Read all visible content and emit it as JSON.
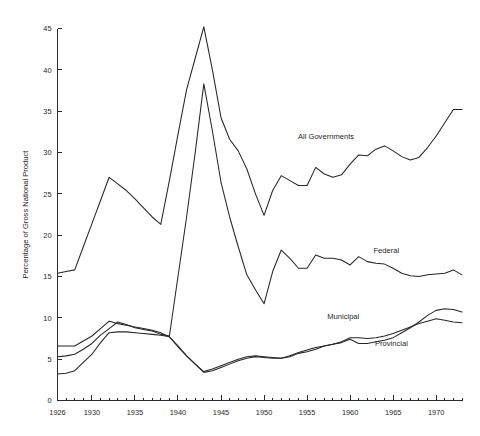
{
  "chart_data": {
    "type": "line",
    "title": "",
    "subtitle": "",
    "xlabel": "",
    "ylabel": "Percentage of Gross National Product",
    "xlim": [
      1926,
      1973
    ],
    "ylim": [
      0,
      45
    ],
    "grid": false,
    "legend_position": "inline-annotations",
    "x_ticks": [
      1926,
      1930,
      1935,
      1940,
      1945,
      1950,
      1955,
      1960,
      1965,
      1970
    ],
    "x_tick_labels": [
      "1926",
      "1930",
      "1935",
      "1940",
      "1945",
      "1950",
      "1955",
      "1960",
      "1965",
      "1970"
    ],
    "x_minor_ticks": [
      1926,
      1927,
      1928,
      1929,
      1930,
      1931,
      1932,
      1933,
      1934,
      1935,
      1936,
      1937,
      1938,
      1939,
      1940,
      1941,
      1942,
      1943,
      1944,
      1945,
      1946,
      1947,
      1948,
      1949,
      1950,
      1951,
      1952,
      1953,
      1954,
      1955,
      1956,
      1957,
      1958,
      1959,
      1960,
      1961,
      1962,
      1963,
      1964,
      1965,
      1966,
      1967,
      1968,
      1969,
      1970,
      1971,
      1972,
      1973
    ],
    "y_ticks": [
      0,
      5,
      10,
      15,
      20,
      25,
      30,
      35,
      40,
      45
    ],
    "y_tick_labels": [
      "0",
      "5",
      "10",
      "15",
      "20",
      "25",
      "30",
      "35",
      "40",
      "45"
    ],
    "x": [
      1926,
      1927,
      1928,
      1929,
      1930,
      1931,
      1932,
      1933,
      1934,
      1935,
      1936,
      1937,
      1938,
      1939,
      1940,
      1941,
      1942,
      1943,
      1944,
      1945,
      1946,
      1947,
      1948,
      1949,
      1950,
      1951,
      1952,
      1953,
      1954,
      1955,
      1956,
      1957,
      1958,
      1959,
      1960,
      1961,
      1962,
      1963,
      1964,
      1965,
      1966,
      1967,
      1968,
      1969,
      1970,
      1971,
      1972,
      1973
    ],
    "series": [
      {
        "name": "All Governments",
        "label": "All Governments",
        "label_x": 1957.2,
        "label_y": 31.6,
        "color": "#262626",
        "values": [
          15.4,
          15.6,
          15.8,
          18.6,
          21.4,
          24.2,
          27.0,
          26.2,
          25.4,
          24.4,
          23.3,
          22.2,
          21.3,
          26.6,
          32.2,
          37.6,
          41.4,
          45.2,
          40.0,
          34.2,
          31.6,
          30.2,
          28.0,
          25.0,
          22.4,
          25.4,
          27.2,
          26.6,
          26.0,
          26.0,
          28.2,
          27.4,
          27.0,
          27.3,
          28.6,
          29.7,
          29.6,
          30.4,
          30.8,
          30.2,
          29.5,
          29.1,
          29.4,
          30.6,
          32.0,
          33.6,
          35.2,
          35.2
        ]
      },
      {
        "name": "Federal",
        "label": "Federal",
        "label_x": 1964.2,
        "label_y": 17.8,
        "color": "#262626",
        "values": [
          5.3,
          5.4,
          5.6,
          6.2,
          6.9,
          7.9,
          8.7,
          9.5,
          9.2,
          8.8,
          8.6,
          8.4,
          8.0,
          7.8,
          15.0,
          22.2,
          30.0,
          38.3,
          32.6,
          26.4,
          22.2,
          18.6,
          15.2,
          13.4,
          11.7,
          15.6,
          18.2,
          17.2,
          16.0,
          16.0,
          17.6,
          17.2,
          17.2,
          17.0,
          16.4,
          17.4,
          16.8,
          16.6,
          16.5,
          16.0,
          15.4,
          15.1,
          15.0,
          15.2,
          15.3,
          15.4,
          15.8,
          15.2
        ]
      },
      {
        "name": "Municipal",
        "label": "Municipal",
        "label_x": 1959.2,
        "label_y": 9.8,
        "color": "#262626",
        "values": [
          6.6,
          6.6,
          6.6,
          7.2,
          7.8,
          8.7,
          9.6,
          9.3,
          9.1,
          8.9,
          8.7,
          8.5,
          8.2,
          7.7,
          6.5,
          5.4,
          4.4,
          3.5,
          3.8,
          4.2,
          4.6,
          5.0,
          5.3,
          5.4,
          5.3,
          5.2,
          5.1,
          5.3,
          5.7,
          5.9,
          6.2,
          6.6,
          6.8,
          7.0,
          7.4,
          6.9,
          6.9,
          7.1,
          7.3,
          7.6,
          8.2,
          8.8,
          9.5,
          10.3,
          10.9,
          11.1,
          11.0,
          10.7
        ]
      },
      {
        "name": "Provincial",
        "label": "Provincial",
        "label_x": 1964.8,
        "label_y": 6.6,
        "color": "#262626",
        "values": [
          3.2,
          3.3,
          3.6,
          4.6,
          5.6,
          7.0,
          8.2,
          8.3,
          8.3,
          8.2,
          8.1,
          8.0,
          7.9,
          7.7,
          6.6,
          5.4,
          4.4,
          3.4,
          3.6,
          4.0,
          4.4,
          4.8,
          5.1,
          5.3,
          5.2,
          5.1,
          5.1,
          5.4,
          5.8,
          6.1,
          6.4,
          6.6,
          6.8,
          7.1,
          7.6,
          7.6,
          7.5,
          7.6,
          7.8,
          8.1,
          8.5,
          8.9,
          9.3,
          9.6,
          9.9,
          9.7,
          9.5,
          9.4
        ]
      }
    ]
  }
}
